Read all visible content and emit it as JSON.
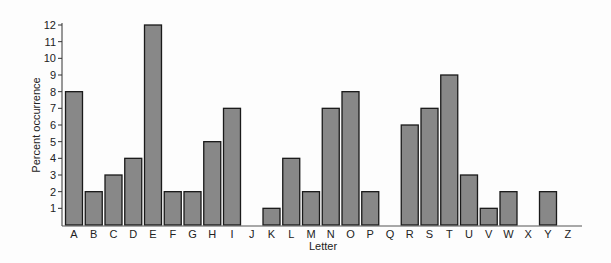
{
  "chart_data": {
    "type": "bar",
    "title": "",
    "xlabel": "Letter",
    "ylabel": "Percent occurrence",
    "ylim": [
      0,
      12
    ],
    "yticks": [
      1,
      2,
      3,
      4,
      5,
      6,
      7,
      8,
      9,
      10,
      11,
      12
    ],
    "grid": false,
    "legend": null,
    "bar_color": "#888888",
    "categories": [
      "A",
      "B",
      "C",
      "D",
      "E",
      "F",
      "G",
      "H",
      "I",
      "J",
      "K",
      "L",
      "M",
      "N",
      "O",
      "P",
      "Q",
      "R",
      "S",
      "T",
      "U",
      "V",
      "W",
      "X",
      "Y",
      "Z"
    ],
    "values": [
      8,
      2,
      3,
      4,
      12,
      2,
      2,
      5,
      7,
      0,
      1,
      4,
      2,
      7,
      8,
      2,
      0,
      6,
      7,
      9,
      3,
      1,
      2,
      0,
      2,
      0
    ]
  }
}
